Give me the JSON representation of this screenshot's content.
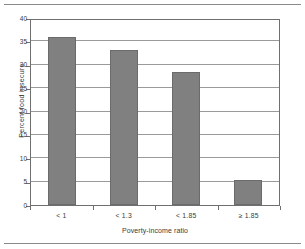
{
  "chart_data": {
    "type": "bar",
    "title": "",
    "xlabel": "Poverty-income ratio",
    "ylabel": "Percent food insecure",
    "categories": [
      "< 1",
      "< 1.3",
      "< 1.85",
      "≥ 1.85"
    ],
    "values": [
      36.0,
      33.2,
      28.4,
      5.3
    ],
    "ylim": [
      0,
      40
    ],
    "yticks": [
      0,
      5,
      10,
      15,
      20,
      25,
      30,
      35,
      40
    ],
    "ytick_labels": [
      "0",
      "5",
      "10",
      "15",
      "20",
      "25",
      "30",
      "35",
      "40"
    ],
    "grid": "horizontal",
    "legend": "none",
    "bar_color": "#808080",
    "bar_edge_color": "#6b6b6b",
    "axis_color": "#6f6f6f",
    "gridline_color": "#9a9a9a"
  }
}
